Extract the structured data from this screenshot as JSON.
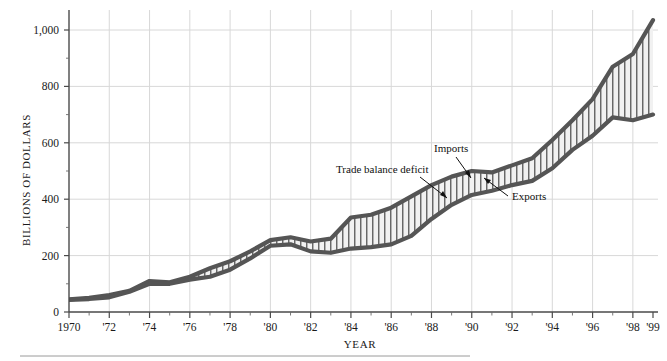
{
  "chart_data": {
    "type": "area",
    "title": "",
    "subtitle": "",
    "xlabel": "YEAR",
    "ylabel": "BILLIONS OF DOLLARS",
    "xlim": [
      1970,
      1999
    ],
    "ylim": [
      0,
      1050
    ],
    "ytick_values": [
      0,
      200,
      400,
      600,
      800,
      1000
    ],
    "ytick_labels": [
      "0",
      "200",
      "400",
      "600",
      "800",
      "1,000"
    ],
    "xtick_values": [
      1970,
      1972,
      1974,
      1976,
      1978,
      1980,
      1982,
      1984,
      1986,
      1988,
      1990,
      1992,
      1994,
      1996,
      1998,
      1999
    ],
    "xtick_labels": [
      "1970",
      "'72",
      "'74",
      "'76",
      "'78",
      "'80",
      "'82",
      "'84",
      "'86",
      "'88",
      "'90",
      "'92",
      "'94",
      "'96",
      "'98",
      "'99"
    ],
    "grid": "both-light",
    "legend_position": "inline-annotations",
    "x": [
      1970,
      1971,
      1972,
      1973,
      1974,
      1975,
      1976,
      1977,
      1978,
      1979,
      1980,
      1981,
      1982,
      1983,
      1984,
      1985,
      1986,
      1987,
      1988,
      1989,
      1990,
      1991,
      1992,
      1993,
      1994,
      1995,
      1996,
      1997,
      1998,
      1999
    ],
    "series": [
      {
        "name": "Imports",
        "color": "#555555",
        "values": [
          45,
          50,
          60,
          75,
          110,
          105,
          125,
          155,
          180,
          215,
          255,
          265,
          250,
          260,
          335,
          345,
          370,
          410,
          450,
          480,
          500,
          495,
          520,
          545,
          610,
          680,
          755,
          870,
          915,
          1035
        ]
      },
      {
        "name": "Exports",
        "color": "#555555",
        "values": [
          43,
          46,
          52,
          72,
          100,
          100,
          115,
          125,
          150,
          190,
          235,
          240,
          215,
          210,
          225,
          230,
          240,
          270,
          330,
          380,
          415,
          430,
          450,
          465,
          510,
          575,
          625,
          690,
          680,
          700
        ]
      }
    ],
    "band": {
      "name": "Trade balance deficit",
      "fill": "#f0f0f0",
      "hatch": "vertical-lines",
      "hatch_color": "#3a3a3a"
    },
    "annotations": [
      {
        "text": "Imports",
        "x": 1988.6,
        "y": 555
      },
      {
        "text": "Trade balance deficit",
        "x": 1983.0,
        "y": 460
      },
      {
        "text": "Exports",
        "x": 1993.2,
        "y": 345
      }
    ]
  },
  "axes": {
    "y_title": "BILLIONS OF DOLLARS",
    "x_title": "YEAR"
  }
}
